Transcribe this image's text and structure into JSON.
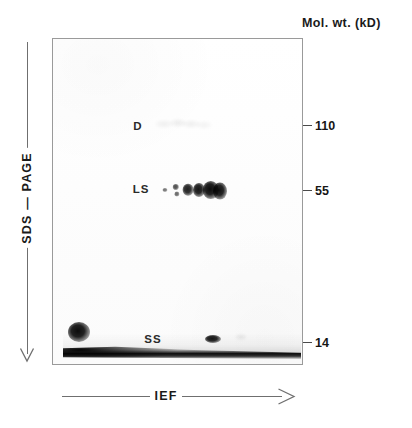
{
  "figure": {
    "header_label": "Mol. wt. (kD)",
    "y_axis_label": "SDS — PAGE",
    "x_axis_label": "IEF",
    "background_color": "#ffffff",
    "panel_border_color": "#9a9a9a",
    "spot_color": "#000000"
  },
  "mw_markers": [
    {
      "label": "110",
      "y": 125
    },
    {
      "label": "55",
      "y": 190
    },
    {
      "label": "14",
      "y": 342
    }
  ],
  "gel_labels": [
    {
      "name": "D",
      "x": 137,
      "y": 125
    },
    {
      "name": "LS",
      "x": 140,
      "y": 188
    },
    {
      "name": "SS",
      "x": 152,
      "y": 338
    }
  ],
  "chart_data": {
    "type": "scatter",
    "xlabel": "IEF",
    "ylabel": "SDS — PAGE",
    "grid": false,
    "legend": "none",
    "y_axis_markers_kD": [
      110,
      55,
      14
    ],
    "panel": {
      "left": 52,
      "top": 38,
      "width": 251,
      "height": 327
    },
    "series": [
      {
        "name": "D",
        "description": "Faint diffuse band row near 110 kD",
        "spots": [
          {
            "x": 163,
            "y": 123,
            "rx": 9,
            "ry": 4,
            "opacity": 0.07
          },
          {
            "x": 177,
            "y": 122,
            "rx": 8,
            "ry": 4,
            "opacity": 0.09
          },
          {
            "x": 190,
            "y": 123,
            "rx": 9,
            "ry": 4,
            "opacity": 0.08
          },
          {
            "x": 203,
            "y": 124,
            "rx": 8,
            "ry": 4,
            "opacity": 0.06
          }
        ]
      },
      {
        "name": "LS",
        "description": "Charge-train isoform spots increasing in size and intensity toward the anode",
        "spots": [
          {
            "x": 164,
            "y": 189,
            "rx": 2.5,
            "ry": 2.0,
            "opacity": 0.55
          },
          {
            "x": 175,
            "y": 186,
            "rx": 3.2,
            "ry": 3.0,
            "opacity": 0.7
          },
          {
            "x": 176,
            "y": 193,
            "rx": 2.6,
            "ry": 2.4,
            "opacity": 0.6
          },
          {
            "x": 187,
            "y": 189,
            "rx": 5.4,
            "ry": 6.2,
            "opacity": 0.9
          },
          {
            "x": 198,
            "y": 189,
            "rx": 6.0,
            "ry": 7.0,
            "opacity": 0.95
          },
          {
            "x": 210,
            "y": 189,
            "rx": 8.2,
            "ry": 9.0,
            "opacity": 0.99
          },
          {
            "x": 219,
            "y": 190,
            "rx": 7.0,
            "ry": 8.4,
            "opacity": 0.97
          }
        ]
      },
      {
        "name": "SS",
        "description": "Dense low molecular weight streak spanning the IEF dimension with a heavy cathodal blob",
        "spots": [
          {
            "x": 78,
            "y": 331,
            "rx": 11,
            "ry": 10,
            "opacity": 0.99
          },
          {
            "x": 212,
            "y": 338,
            "rx": 8,
            "ry": 4,
            "opacity": 0.95
          },
          {
            "x": 240,
            "y": 336,
            "rx": 6,
            "ry": 3,
            "opacity": 0.1
          }
        ],
        "streak": {
          "from_x": 62,
          "to_x": 300,
          "y": 352,
          "description": "continuous dark horizontal streak just above the 14 kD marker"
        }
      }
    ]
  }
}
